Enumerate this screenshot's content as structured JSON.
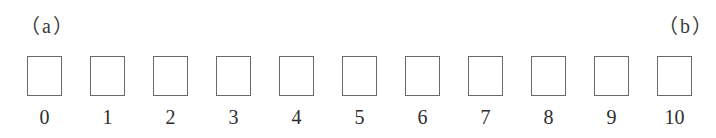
{
  "labels": {
    "left": "（a）",
    "right": "（b）"
  },
  "cells": [
    {
      "index": "0"
    },
    {
      "index": "1"
    },
    {
      "index": "2"
    },
    {
      "index": "3"
    },
    {
      "index": "4"
    },
    {
      "index": "5"
    },
    {
      "index": "6"
    },
    {
      "index": "7"
    },
    {
      "index": "8"
    },
    {
      "index": "9"
    },
    {
      "index": "10"
    }
  ],
  "layout": {
    "first_x": 27,
    "spacing": 63
  }
}
